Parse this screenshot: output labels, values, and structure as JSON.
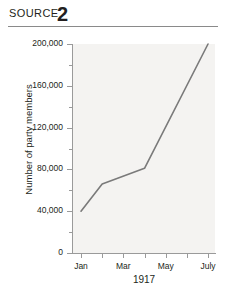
{
  "header": {
    "source_label": "SOURCE",
    "source_number": "2"
  },
  "chart_data": {
    "type": "line",
    "title": "",
    "xlabel": "1917",
    "ylabel": "Number of party members",
    "grid": false,
    "legend": false,
    "line_color": "#7a7a7a",
    "plot_background": "#f4f3f1",
    "axis_color": "#9a9a9a",
    "ylim": [
      0,
      200000
    ],
    "ytick_step": 40000,
    "yminor_step": 20000,
    "ytick_labels": [
      "0",
      "40,000",
      "80,000",
      "120,000",
      "160,000",
      "200,000"
    ],
    "ytick_values": [
      0,
      40000,
      80000,
      120000,
      160000,
      200000
    ],
    "xlim_labels": [
      "Jan",
      "Feb",
      "Mar",
      "Apr",
      "May",
      "Jun",
      "July"
    ],
    "xtick_labels": [
      "Jan",
      "",
      "Mar",
      "",
      "May",
      "",
      "July"
    ],
    "x": [
      "Jan",
      "Feb",
      "Apr",
      "July"
    ],
    "values": [
      40000,
      66000,
      81000,
      200000
    ],
    "points": [
      {
        "x": "Jan",
        "y": 40000
      },
      {
        "x": "Feb",
        "y": 66000
      },
      {
        "x": "Apr",
        "y": 81000
      },
      {
        "x": "July",
        "y": 200000
      }
    ]
  }
}
